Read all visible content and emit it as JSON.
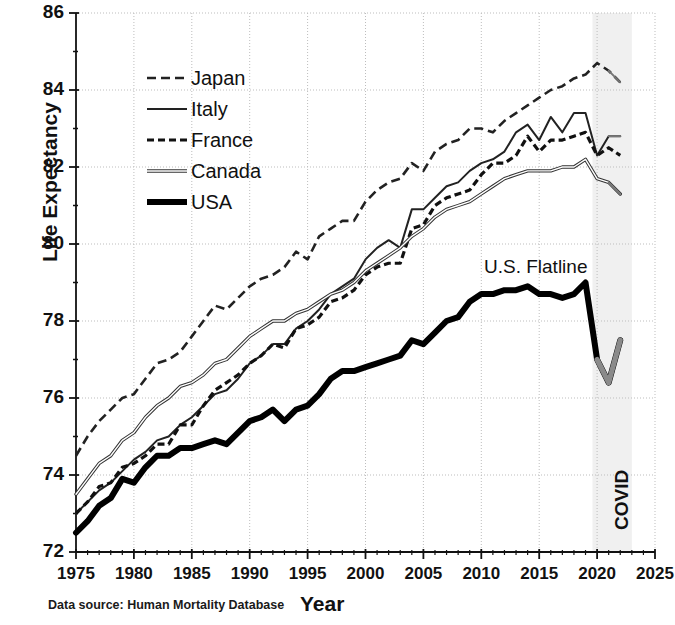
{
  "chart_data": {
    "type": "line",
    "title": "",
    "xlabel": "Year",
    "ylabel": "Life Expectancy",
    "xlim": [
      1975,
      2025
    ],
    "ylim": [
      72,
      86
    ],
    "xticks": [
      1975,
      1980,
      1985,
      1990,
      1995,
      2000,
      2005,
      2010,
      2015,
      2020,
      2025
    ],
    "yticks": [
      72,
      74,
      76,
      78,
      80,
      82,
      84,
      86
    ],
    "grid": "dotted major gridlines, both axes",
    "legend_position": "upper left inside axes",
    "x": [
      1975,
      1976,
      1977,
      1978,
      1979,
      1980,
      1981,
      1982,
      1983,
      1984,
      1985,
      1986,
      1987,
      1988,
      1989,
      1990,
      1991,
      1992,
      1993,
      1994,
      1995,
      1996,
      1997,
      1998,
      1999,
      2000,
      2001,
      2002,
      2003,
      2004,
      2005,
      2006,
      2007,
      2008,
      2009,
      2010,
      2011,
      2012,
      2013,
      2014,
      2015,
      2016,
      2017,
      2018,
      2019,
      2020,
      2021,
      2022
    ],
    "series": [
      {
        "name": "Japan",
        "style": "long-dashed",
        "color": "#222222",
        "values": [
          74.5,
          75.0,
          75.4,
          75.7,
          76.0,
          76.1,
          76.5,
          76.9,
          77.0,
          77.2,
          77.6,
          78.0,
          78.4,
          78.3,
          78.6,
          78.9,
          79.1,
          79.2,
          79.4,
          79.8,
          79.6,
          80.2,
          80.4,
          80.6,
          80.6,
          81.1,
          81.4,
          81.6,
          81.7,
          82.1,
          81.9,
          82.4,
          82.6,
          82.7,
          83.0,
          83.0,
          82.9,
          83.2,
          83.4,
          83.6,
          83.8,
          84.0,
          84.1,
          84.3,
          84.4,
          84.7,
          84.5,
          84.2
        ]
      },
      {
        "name": "Italy",
        "style": "thin-solid",
        "color": "#222222",
        "values": [
          73.0,
          73.3,
          73.6,
          73.8,
          74.1,
          74.4,
          74.6,
          74.9,
          75.0,
          75.3,
          75.5,
          75.8,
          76.1,
          76.2,
          76.5,
          76.9,
          77.1,
          77.4,
          77.4,
          77.8,
          78.0,
          78.3,
          78.7,
          78.9,
          79.1,
          79.6,
          79.9,
          80.1,
          79.9,
          80.9,
          80.9,
          81.2,
          81.5,
          81.6,
          81.9,
          82.1,
          82.2,
          82.4,
          82.9,
          83.1,
          82.7,
          83.3,
          82.9,
          83.4,
          83.4,
          82.3,
          82.8,
          82.8
        ]
      },
      {
        "name": "France",
        "style": "short-dashed",
        "color": "#111111",
        "values": [
          73.0,
          73.3,
          73.7,
          73.8,
          74.2,
          74.3,
          74.5,
          74.8,
          74.8,
          75.3,
          75.3,
          75.8,
          76.2,
          76.4,
          76.6,
          76.9,
          77.1,
          77.4,
          77.3,
          77.8,
          77.9,
          78.1,
          78.5,
          78.6,
          78.8,
          79.2,
          79.4,
          79.5,
          79.5,
          80.4,
          80.5,
          81.0,
          81.2,
          81.3,
          81.4,
          81.8,
          82.1,
          82.1,
          82.3,
          82.8,
          82.4,
          82.7,
          82.7,
          82.8,
          82.9,
          82.3,
          82.5,
          82.3
        ]
      },
      {
        "name": "Canada",
        "style": "medium-solid",
        "color": "#555555",
        "values": [
          73.5,
          73.9,
          74.3,
          74.5,
          74.9,
          75.1,
          75.5,
          75.8,
          76.0,
          76.3,
          76.4,
          76.6,
          76.9,
          77.0,
          77.3,
          77.6,
          77.8,
          78.0,
          78.0,
          78.2,
          78.3,
          78.5,
          78.7,
          78.8,
          79.0,
          79.3,
          79.5,
          79.7,
          79.9,
          80.2,
          80.4,
          80.7,
          80.9,
          81.0,
          81.1,
          81.3,
          81.5,
          81.7,
          81.8,
          81.9,
          81.9,
          81.9,
          82.0,
          82.0,
          82.2,
          81.7,
          81.6,
          81.3
        ]
      },
      {
        "name": "USA",
        "style": "thick-solid",
        "color": "#000000",
        "values": [
          72.5,
          72.8,
          73.2,
          73.4,
          73.9,
          73.8,
          74.2,
          74.5,
          74.5,
          74.7,
          74.7,
          74.8,
          74.9,
          74.8,
          75.1,
          75.4,
          75.5,
          75.7,
          75.4,
          75.7,
          75.8,
          76.1,
          76.5,
          76.7,
          76.7,
          76.8,
          76.9,
          77.0,
          77.1,
          77.5,
          77.4,
          77.7,
          78.0,
          78.1,
          78.5,
          78.7,
          78.7,
          78.8,
          78.8,
          78.9,
          78.7,
          78.7,
          78.6,
          78.7,
          79.0,
          77.0,
          76.4,
          77.5
        ]
      }
    ],
    "annotations": [
      {
        "text": "U.S. Flatline",
        "x": 2011.5,
        "y": 79.6
      },
      {
        "text": "COVID",
        "x": 2021.5,
        "y": 73.6,
        "rotation": 90
      }
    ],
    "shaded_regions": [
      {
        "label": "COVID",
        "x_start": 2019.6,
        "x_end": 2023.0,
        "color": "#f0f0f0"
      }
    ],
    "caption": "Data source: Human Mortality Database"
  },
  "legend": {
    "items": [
      {
        "label": "Japan",
        "style": "long-dashed"
      },
      {
        "label": "Italy",
        "style": "thin-solid"
      },
      {
        "label": "France",
        "style": "short-dashed"
      },
      {
        "label": "Canada",
        "style": "medium-solid"
      },
      {
        "label": "USA",
        "style": "thick-solid"
      }
    ]
  },
  "axis": {
    "y_title": "Life Expectancy",
    "x_title": "Year",
    "y_ticks": [
      "86",
      "84",
      "82",
      "80",
      "78",
      "76",
      "74",
      "72"
    ],
    "x_ticks": [
      "1975",
      "1980",
      "1985",
      "1990",
      "1995",
      "2000",
      "2005",
      "2010",
      "2015",
      "2020",
      "2025"
    ]
  },
  "annotations": {
    "flatline": "U.S. Flatline",
    "covid": "COVID"
  },
  "caption": "Data source: Human Mortality Database"
}
